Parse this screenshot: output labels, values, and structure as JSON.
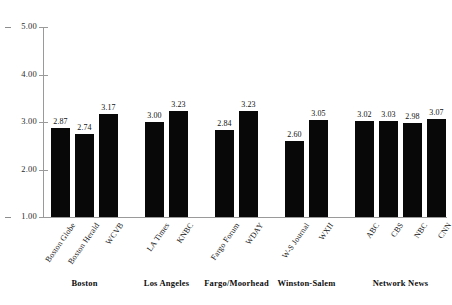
{
  "chart_data": {
    "type": "bar",
    "title": "",
    "subtitle": "",
    "xlabel": "",
    "ylabel": "",
    "ylim": [
      1.0,
      5.0
    ],
    "ytick_labels": [
      "5.00",
      "4.00",
      "3.00",
      "2.00",
      "1.00"
    ],
    "ytick_values": [
      5.0,
      4.0,
      3.0,
      2.0,
      1.0
    ],
    "grid": false,
    "legend": "none",
    "bar_color": "#080808",
    "axis_color": "#9a9a9a",
    "categories": [
      "Boston Globe",
      "Boston Herald",
      "WCVB",
      "LA Times",
      "KNBC",
      "Fargo Forum",
      "WDAY",
      "W-S Journal",
      "WXII",
      "ABC",
      "CBS",
      "NBC",
      "CNN"
    ],
    "values": [
      2.87,
      2.74,
      3.17,
      3.0,
      3.23,
      2.84,
      3.23,
      2.6,
      3.05,
      3.02,
      3.03,
      2.98,
      3.07
    ],
    "value_labels": [
      "2.87",
      "2.74",
      "3.17",
      "3.00",
      "3.23",
      "2.84",
      "3.23",
      "2.60",
      "3.05",
      "3.02",
      "3.03",
      "2.98",
      "3.07"
    ],
    "groups": [
      {
        "label": "Boston",
        "members": [
          "Boston Globe",
          "Boston Herald",
          "WCVB"
        ]
      },
      {
        "label": "Los Angeles",
        "members": [
          "LA Times",
          "KNBC"
        ]
      },
      {
        "label": "Fargo/Moorhead",
        "members": [
          "Fargo Forum",
          "WDAY"
        ]
      },
      {
        "label": "Winston-Salem",
        "members": [
          "W-S Journal",
          "WXII"
        ]
      },
      {
        "label": "Network News",
        "members": [
          "ABC",
          "CBS",
          "NBC",
          "CNN"
        ]
      }
    ]
  },
  "axis": {
    "y_ticks": [
      {
        "label": "5.00"
      },
      {
        "label": "4.00"
      },
      {
        "label": "3.00"
      },
      {
        "label": "2.00"
      },
      {
        "label": "1.00"
      }
    ]
  },
  "bars": [
    {
      "name": "Boston Globe",
      "label": "Boston Globe",
      "value_label": "2.87"
    },
    {
      "name": "Boston Herald",
      "label": "Boston Herald",
      "value_label": "2.74"
    },
    {
      "name": "WCVB",
      "label": "WCVB",
      "value_label": "3.17"
    },
    {
      "name": "LA Times",
      "label": "LA Times",
      "value_label": "3.00"
    },
    {
      "name": "KNBC",
      "label": "KNBC",
      "value_label": "3.23"
    },
    {
      "name": "Fargo Forum",
      "label": "Fargo Forum",
      "value_label": "2.84"
    },
    {
      "name": "WDAY",
      "label": "WDAY",
      "value_label": "3.23"
    },
    {
      "name": "W-S Journal",
      "label": "W-S Journal",
      "value_label": "2.60"
    },
    {
      "name": "WXII",
      "label": "WXII",
      "value_label": "3.05"
    },
    {
      "name": "ABC",
      "label": "ABC",
      "value_label": "3.02"
    },
    {
      "name": "CBS",
      "label": "CBS",
      "value_label": "3.03"
    },
    {
      "name": "NBC",
      "label": "NBC",
      "value_label": "2.98"
    },
    {
      "name": "CNN",
      "label": "CNN",
      "value_label": "3.07"
    }
  ],
  "groups": [
    {
      "label": "Boston"
    },
    {
      "label": "Los Angeles"
    },
    {
      "label": "Fargo/Moorhead"
    },
    {
      "label": "Winston-Salem"
    },
    {
      "label": "Network News"
    }
  ]
}
